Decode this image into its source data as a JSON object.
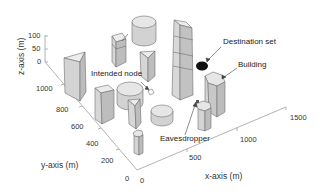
{
  "figure": {
    "type": "3d-scene",
    "axes": {
      "x": {
        "title": "x-axis (m)",
        "ticks": [
          "0",
          "500",
          "1000",
          "1500"
        ]
      },
      "y": {
        "title": "y-axis (m)",
        "ticks": [
          "0",
          "200",
          "400",
          "600",
          "800",
          "1000"
        ]
      },
      "z": {
        "title": "z-axis (m)",
        "ticks": [
          "0",
          "50",
          "100"
        ]
      }
    },
    "annotations": [
      {
        "id": "destination",
        "text": "Destination set"
      },
      {
        "id": "building",
        "text": "Building"
      },
      {
        "id": "intended",
        "text": "Intended node"
      },
      {
        "id": "eavesdropper",
        "text": "Eavesdropper"
      }
    ],
    "colors": {
      "building_face": "#d9d9d9",
      "building_side": "#bdbdbd",
      "building_top": "#e8e8e8",
      "edge": "#6e6e6e",
      "destination": "#111111",
      "axis": "#9a9a9a"
    }
  }
}
